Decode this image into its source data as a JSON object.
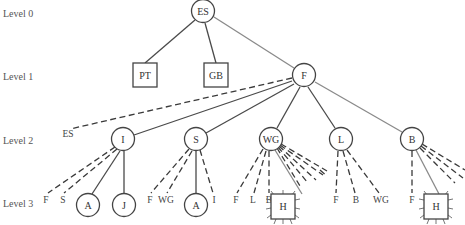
{
  "levels": [
    {
      "label": "Level 0",
      "y": 14
    },
    {
      "label": "Level 1",
      "y": 78
    },
    {
      "label": "Level 2",
      "y": 142
    },
    {
      "label": "Level 3",
      "y": 203
    }
  ],
  "nodes": {
    "es": {
      "label": "ES",
      "shape": "circle",
      "level": 0
    },
    "pt": {
      "label": "PT",
      "shape": "square",
      "level": 1
    },
    "gb": {
      "label": "GB",
      "shape": "square",
      "level": 1
    },
    "f": {
      "label": "F",
      "shape": "circle",
      "level": 1
    },
    "i": {
      "label": "I",
      "shape": "circle",
      "level": 2
    },
    "s": {
      "label": "S",
      "shape": "circle",
      "level": 2
    },
    "wg": {
      "label": "WG",
      "shape": "circle",
      "level": 2
    },
    "l": {
      "label": "L",
      "shape": "circle",
      "level": 2
    },
    "b": {
      "label": "B",
      "shape": "circle",
      "level": 2
    },
    "i_a": {
      "label": "A",
      "shape": "circle",
      "level": 3
    },
    "i_j": {
      "label": "J",
      "shape": "circle",
      "level": 3
    },
    "s_a": {
      "label": "A",
      "shape": "circle",
      "level": 3
    },
    "wg_h": {
      "label": "H",
      "shape": "square-spiked",
      "level": 3
    },
    "b_h": {
      "label": "H",
      "shape": "square-spiked",
      "level": 3
    }
  },
  "dashed_labels": {
    "f_es": "ES",
    "i_f": "F",
    "i_s": "S",
    "s_f": "F",
    "s_wg": "WG",
    "s_i": "I",
    "wg_f": "F",
    "wg_l": "L",
    "wg_b": "B",
    "l_f": "F",
    "l_b": "B",
    "l_wg": "WG",
    "b_f": "F"
  },
  "edges": [
    {
      "from": "ES",
      "to": "PT",
      "style": "solid"
    },
    {
      "from": "ES",
      "to": "GB",
      "style": "solid"
    },
    {
      "from": "ES",
      "to": "F",
      "style": "solid-gray"
    },
    {
      "from": "F",
      "to": "ES",
      "style": "dashed"
    },
    {
      "from": "F",
      "to": "I",
      "style": "solid"
    },
    {
      "from": "F",
      "to": "S",
      "style": "solid"
    },
    {
      "from": "F",
      "to": "WG",
      "style": "solid"
    },
    {
      "from": "F",
      "to": "L",
      "style": "solid"
    },
    {
      "from": "F",
      "to": "B",
      "style": "solid-gray"
    },
    {
      "from": "I",
      "to": "F",
      "style": "dashed"
    },
    {
      "from": "I",
      "to": "S",
      "style": "dashed"
    },
    {
      "from": "I",
      "to": "A",
      "style": "solid"
    },
    {
      "from": "I",
      "to": "J",
      "style": "solid"
    },
    {
      "from": "S",
      "to": "F",
      "style": "dashed"
    },
    {
      "from": "S",
      "to": "WG",
      "style": "dashed"
    },
    {
      "from": "S",
      "to": "A",
      "style": "solid"
    },
    {
      "from": "S",
      "to": "I",
      "style": "dashed"
    },
    {
      "from": "WG",
      "to": "F",
      "style": "dashed"
    },
    {
      "from": "WG",
      "to": "L",
      "style": "dashed"
    },
    {
      "from": "WG",
      "to": "B",
      "style": "dashed"
    },
    {
      "from": "WG",
      "to": "H",
      "style": "solid-gray"
    },
    {
      "from": "L",
      "to": "F",
      "style": "dashed"
    },
    {
      "from": "L",
      "to": "B",
      "style": "dashed"
    },
    {
      "from": "L",
      "to": "WG",
      "style": "dashed"
    },
    {
      "from": "B",
      "to": "F",
      "style": "dashed"
    },
    {
      "from": "B",
      "to": "H",
      "style": "solid-gray"
    }
  ]
}
